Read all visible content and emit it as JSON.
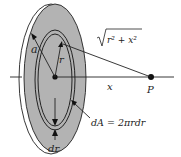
{
  "diagram": {
    "labels": {
      "a": "a",
      "r": "r",
      "x": "x",
      "P": "P",
      "dr": "dr",
      "distance_radicand": "r² + x²",
      "area_element": "dA = 2πrdr"
    },
    "colors": {
      "disk_fill": "#b3b3b3",
      "stroke": "#222222",
      "background": "#ffffff"
    }
  }
}
